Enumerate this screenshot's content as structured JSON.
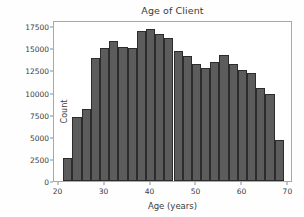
{
  "figure": {
    "background_color": "#fefefe",
    "plot_background_color": "#ffffff",
    "axis_color": "#a8a8a8",
    "bar_fill_color": "#5c5c5c",
    "bar_edge_color": "#2c2c2c",
    "text_color": "#3b3b3b"
  },
  "chart_data": {
    "type": "bar",
    "title": "Age of Client",
    "xlabel": "Age (years)",
    "ylabel": "Count",
    "xlim": [
      19.0,
      71.0
    ],
    "ylim": [
      0,
      18200
    ],
    "grid": false,
    "legend": null,
    "bin_width": 2,
    "xticks": [
      20,
      30,
      40,
      50,
      60,
      70
    ],
    "xtick_labels": [
      "20",
      "30",
      "40",
      "50",
      "60",
      "70"
    ],
    "yticks": [
      0,
      2500,
      5000,
      7500,
      10000,
      12500,
      15000,
      17500
    ],
    "ytick_labels": [
      "0",
      "2500",
      "5000",
      "7500",
      "10000",
      "12500",
      "15000",
      "17500"
    ],
    "bin_edges": [
      21,
      23,
      25,
      27,
      29,
      31,
      33,
      35,
      37,
      39,
      41,
      43,
      45,
      47,
      49,
      51,
      53,
      55,
      57,
      59,
      61,
      63,
      65,
      67,
      69
    ],
    "categories": [
      "21-23",
      "23-25",
      "25-27",
      "27-29",
      "29-31",
      "31-33",
      "33-35",
      "35-37",
      "37-39",
      "39-41",
      "41-43",
      "43-45",
      "45-47",
      "47-49",
      "49-51",
      "51-53",
      "53-55",
      "55-57",
      "57-59",
      "59-61",
      "61-63",
      "63-65",
      "65-67",
      "67-69"
    ],
    "values": [
      2650,
      7200,
      8100,
      13950,
      15000,
      15850,
      15200,
      15050,
      17000,
      17200,
      16600,
      16200,
      14700,
      14150,
      13200,
      12750,
      13500,
      14200,
      13200,
      12500,
      12200,
      10500,
      9800,
      4600
    ]
  }
}
